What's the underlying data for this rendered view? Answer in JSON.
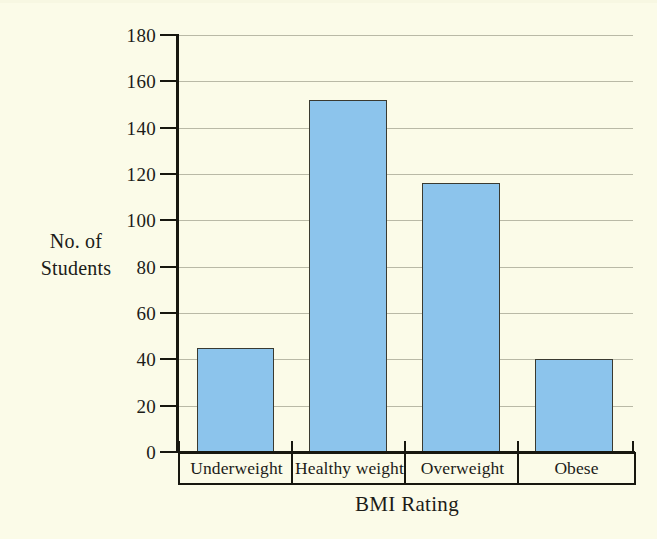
{
  "chart_data": {
    "type": "bar",
    "title": "",
    "categories": [
      "Underweight",
      "Healthy weight",
      "Overweight",
      "Obese"
    ],
    "values": [
      45,
      152,
      116,
      40
    ],
    "series": [
      {
        "name": "No. of Students",
        "values": [
          45,
          152,
          116,
          40
        ]
      }
    ],
    "xlabel": "BMI Rating",
    "ylabel": "No. of Students",
    "ylabel_lines": [
      "No. of",
      "Students"
    ],
    "ylim": [
      0,
      180
    ],
    "ytick_labels": [
      "0",
      "20",
      "40",
      "60",
      "80",
      "100",
      "120",
      "140",
      "160",
      "180"
    ],
    "ytick_values": [
      0,
      20,
      40,
      60,
      80,
      100,
      120,
      140,
      160,
      180
    ],
    "grid": true,
    "legend": "none",
    "orientation": "vertical",
    "bar_color": "#8cc4ec",
    "bar_edge_color": "#3a3a30",
    "background_color": "#fbfbe8",
    "axis_color": "#17170f",
    "gridline_color": "#b9b9a6"
  }
}
